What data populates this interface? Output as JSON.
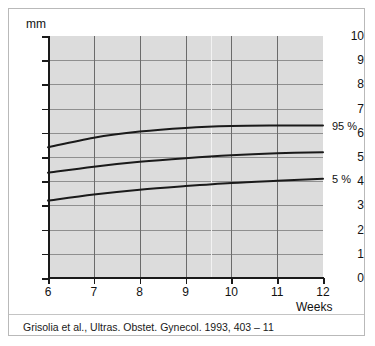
{
  "figure": {
    "caption": "Grisolia et al., Ultras. Obstet. Gynecol. 1993, 403 – 11"
  },
  "colors": {
    "plot_background": "#dcdcdc",
    "page_background": "#ffffff",
    "curve": "#1a1a1a",
    "gridline_major": "#6b6b6b",
    "gridline_minor": "#8f8f8f",
    "frame_border": "#b9b9b9",
    "text": "#1a1a1a"
  },
  "chart_data": {
    "type": "line",
    "title": "",
    "subtitle": "",
    "xlabel": "Weeks",
    "ylabel": "mm",
    "xlim": [
      6,
      12
    ],
    "ylim": [
      0,
      10
    ],
    "grid": true,
    "legend_position": "right-inline",
    "x_ticks": [
      6,
      7,
      8,
      9,
      10,
      11,
      12
    ],
    "x_tick_labels": [
      "6",
      "7",
      "8",
      "9",
      "10",
      "11",
      "12"
    ],
    "y_ticks": [
      0,
      1,
      2,
      3,
      4,
      5,
      6,
      7,
      8,
      9,
      10
    ],
    "y_tick_labels": [
      "0",
      "1",
      "2",
      "3",
      "4",
      "5",
      "6",
      "7",
      "8",
      "9",
      "10"
    ],
    "x": [
      6,
      7,
      8,
      9,
      10,
      11,
      12
    ],
    "series": [
      {
        "name": "95 %",
        "label": "95 %",
        "values": [
          5.4,
          5.8,
          6.05,
          6.2,
          6.28,
          6.3,
          6.3
        ]
      },
      {
        "name": "50 %",
        "label": "",
        "values": [
          4.35,
          4.6,
          4.8,
          4.95,
          5.07,
          5.15,
          5.2
        ]
      },
      {
        "name": "5 %",
        "label": "5 %",
        "values": [
          3.2,
          3.45,
          3.65,
          3.8,
          3.93,
          4.02,
          4.1
        ]
      }
    ],
    "annotations": [
      {
        "text": "95 %",
        "x": 12,
        "y": 6.3
      },
      {
        "text": "5 %",
        "x": 12,
        "y": 4.1
      }
    ]
  }
}
